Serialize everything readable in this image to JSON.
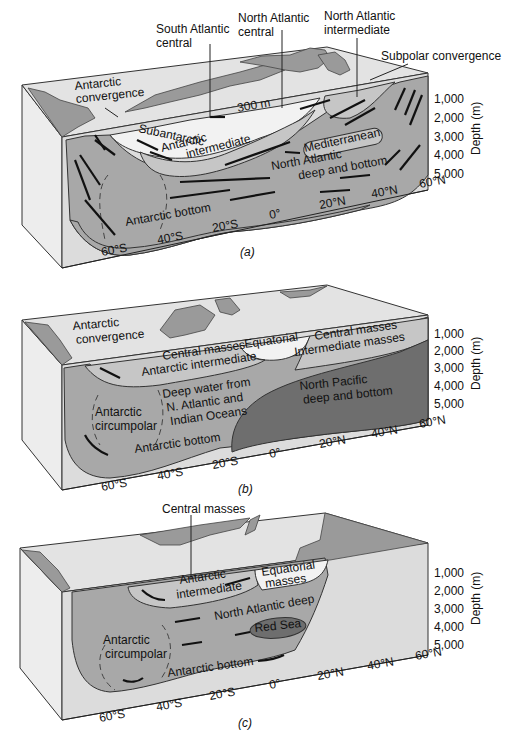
{
  "figure": {
    "panels": [
      {
        "id": "a",
        "caption": "(a)",
        "callouts": {
          "south_atlantic_central": [
            "South Atlantic",
            "central"
          ],
          "north_atlantic_central": [
            "North Atlantic",
            "central"
          ],
          "north_atlantic_intermediate": [
            "North Atlantic",
            "intermediate"
          ],
          "subpolar_convergence": "Subpolar convergence",
          "antarctic_convergence": [
            "Antarctic",
            "convergence"
          ]
        },
        "labels": {
          "depth_300": "300 m",
          "subantarctic": "Subantarctic",
          "antarctic_intermediate": [
            "Antarctic",
            "intermediate"
          ],
          "mediterranean": "Mediterranean",
          "north_atlantic_deep": [
            "North Atlantic",
            "deep and bottom"
          ],
          "antarctic_bottom": "Antarctic bottom"
        }
      },
      {
        "id": "b",
        "caption": "(b)",
        "labels": {
          "antarctic_convergence": [
            "Antarctic",
            "convergence"
          ],
          "central_masses_left": "Central masses",
          "equatorial": "Equatorial",
          "central_masses_right": "Central masses",
          "intermediate_masses": "Intermediate masses",
          "antarctic_intermediate": "Antarctic intermediate",
          "deep_water": [
            "Deep water from",
            "N. Atlantic and",
            "Indian Oceans"
          ],
          "antarctic_circumpolar": [
            "Antarctic",
            "circumpolar"
          ],
          "north_pacific": [
            "North Pacific",
            "deep and bottom"
          ],
          "antarctic_bottom": "Antarctic bottom"
        }
      },
      {
        "id": "c",
        "caption": "(c)",
        "callouts": {
          "central_masses": "Central masses"
        },
        "labels": {
          "antarctic_intermediate": [
            "Antarctic",
            "intermediate"
          ],
          "equatorial_masses": [
            "Equatorial",
            "masses"
          ],
          "north_atlantic_deep": "North Atlantic deep",
          "red_sea": "Red Sea",
          "antarctic_circumpolar": [
            "Antarctic",
            "circumpolar"
          ],
          "antarctic_bottom": "Antarctic bottom"
        }
      }
    ],
    "depth_axis": {
      "title": "Depth (m)",
      "ticks": [
        "1,000",
        "2,000",
        "3,000",
        "4,000",
        "5,000"
      ]
    },
    "latitude_axis": {
      "ticks": [
        "60°S",
        "40°S",
        "20°S",
        "0°",
        "20°N",
        "40°N",
        "60°N"
      ]
    },
    "colors": {
      "top_surface": "#e3e3e3",
      "land": "#9a9a9a",
      "mid_water": "#a8a8a8",
      "light_water": "#c6c6c6",
      "dark_water": "#6e6e6e",
      "white_water": "#f2f2f2"
    }
  }
}
